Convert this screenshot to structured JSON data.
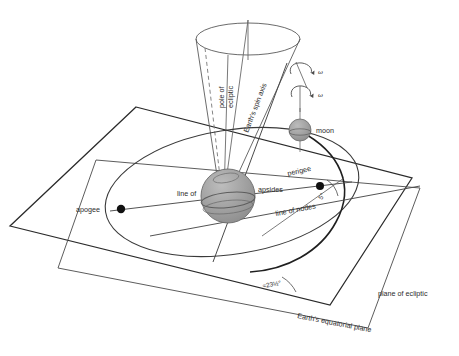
{
  "figure": {
    "background": "#ffffff",
    "line_color": "#3a3a3a",
    "heavy_line_color": "#2a2a2a",
    "sphere_fill": "#9e9e9e",
    "sphere_shade": "#8a8a8a",
    "marker_color": "#111111"
  },
  "labels": {
    "pole_of_ecliptic_line1": "pole of",
    "pole_of_ecliptic_line2": "ecliptic",
    "earths_spin_axis": "Earth's spin axis",
    "moon": "moon",
    "omega_upper": "ω",
    "omega_lower": "ω",
    "perigee": "perigee",
    "apogee": "apogee",
    "line_of": "line of",
    "apsides": "apsides",
    "line_of_nodes": "line of nodes",
    "inclination_angle": "5°",
    "obliquity_angle": "≈23½°",
    "plane_of_ecliptic": "plane of ecliptic",
    "earths_equatorial_plane": "Earth's equatorial plane"
  },
  "values": {
    "obliquity_degrees": 23.5,
    "moon_orbit_inclination_degrees": 5,
    "earth_rotation_symbol": "ω",
    "moon_rotation_symbol": "ω"
  },
  "elements": {
    "precession_cone": "precession-cone",
    "ecliptic_plane_quad": "ecliptic-plane",
    "equatorial_plane_quad": "equatorial-plane",
    "moon_orbit_ellipse": "moon-orbit",
    "earth_sphere": "earth-sphere",
    "moon_sphere": "moon-sphere",
    "apogee_marker": "apogee-marker",
    "perigee_marker": "perigee-marker"
  }
}
